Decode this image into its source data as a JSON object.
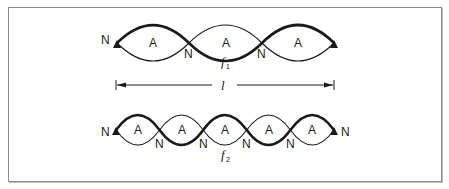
{
  "figure": {
    "frame_color": "#8a8a8a",
    "stroke_color": "#1a1a1a"
  },
  "wave1": {
    "label_main": "f",
    "label_sub": "1",
    "loops": 3,
    "node_label": "N",
    "antinode_label": "A",
    "node_labels": [
      "N",
      "N",
      "N"
    ],
    "antinode_labels": [
      "A",
      "A",
      "A"
    ]
  },
  "length_marker": {
    "symbol": "l"
  },
  "wave2": {
    "label_main": "f",
    "label_sub": "2",
    "loops": 5,
    "node_labels": [
      "N",
      "N",
      "N",
      "N",
      "N",
      "N"
    ],
    "antinode_labels": [
      "A",
      "A",
      "A",
      "A",
      "A"
    ]
  }
}
